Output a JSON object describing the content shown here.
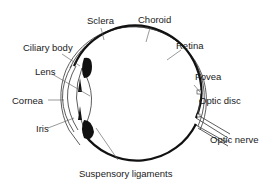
{
  "diagram": {
    "title": "",
    "colors": {
      "line": "#333333",
      "fill_dark": "#111111",
      "background": "#ffffff",
      "text": "#1a1a1a"
    },
    "labels": {
      "sclera": "Sclera",
      "choroid": "Choroid",
      "ciliary_body": "Ciliary body",
      "retina": "Retina",
      "lens": "Lens",
      "fovea": "Fovea",
      "cornea": "Cornea",
      "optic_disc": "Optic disc",
      "iris": "Iris",
      "optic_nerve": "Optic nerve",
      "suspensory_ligaments": "Suspensory ligaments"
    }
  }
}
